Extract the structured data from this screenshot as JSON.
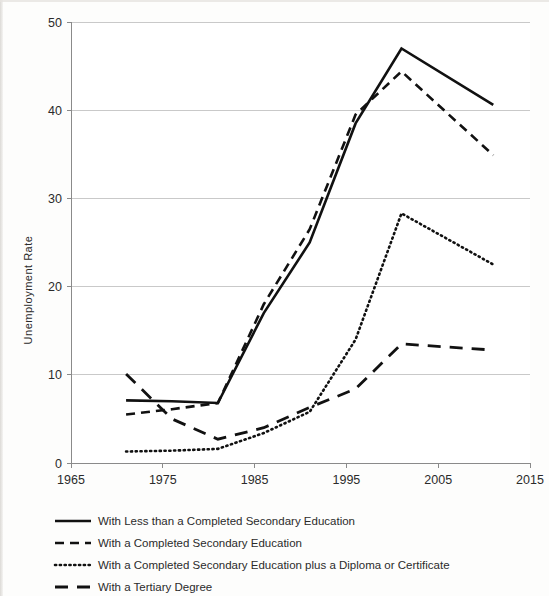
{
  "chart_data": {
    "type": "line",
    "title": "",
    "xlabel": "",
    "ylabel": "Unemployment Rate",
    "xlim": [
      1965,
      2015
    ],
    "ylim": [
      0,
      50
    ],
    "xticks": [
      "1965",
      "1975",
      "1985",
      "1995",
      "2005",
      "2015"
    ],
    "yticks": [
      "0",
      "10",
      "20",
      "30",
      "40",
      "50"
    ],
    "grid": "horizontal",
    "legend_position": "below",
    "x": [
      1971,
      1976,
      1981,
      1986,
      1991,
      1996,
      2001,
      2011
    ],
    "series": [
      {
        "name": "With Less than a Completed Secondary Education",
        "style": "solid",
        "values": [
          7.1,
          7.0,
          6.8,
          17.0,
          25.0,
          38.5,
          47.0,
          40.6
        ]
      },
      {
        "name": "With a Completed Secondary Education",
        "style": "dashed",
        "values": [
          5.5,
          6.1,
          6.8,
          18.0,
          26.5,
          39.5,
          44.4,
          34.9
        ]
      },
      {
        "name": "With a Completed Secondary Education plus a Diploma or Certificate",
        "style": "dotted",
        "values": [
          1.3,
          1.4,
          1.6,
          3.4,
          5.8,
          14.0,
          28.3,
          22.5
        ]
      },
      {
        "name": "With a Tertiary Degree",
        "style": "long-dash",
        "values": [
          10.1,
          5.0,
          2.7,
          4.0,
          6.3,
          8.4,
          13.5,
          12.8
        ]
      }
    ]
  },
  "legend": {
    "items": [
      {
        "label": "With Less than a Completed Secondary Education",
        "style": "solid"
      },
      {
        "label": "With a Completed Secondary Education",
        "style": "dashed"
      },
      {
        "label": "With a Completed Secondary Education plus a Diploma or Certificate",
        "style": "dotted"
      },
      {
        "label": "With a Tertiary Degree",
        "style": "long-dash"
      }
    ]
  },
  "colors": {
    "ink": "#111111",
    "gridline": "#c9c9c9",
    "axis": "#8a8a8a",
    "background": "#fdfdfc"
  }
}
